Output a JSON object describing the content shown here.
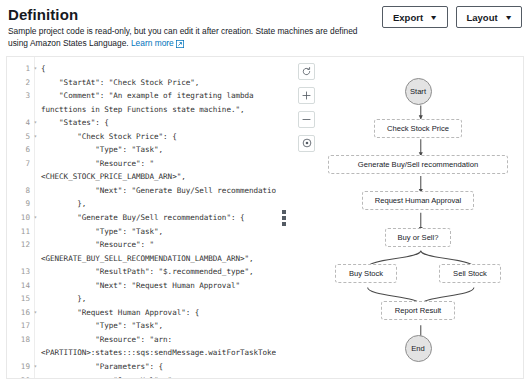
{
  "header": {
    "title": "Definition",
    "description_line1": "Sample project code is read-only, but you can edit it after creation. State machines are defined using",
    "description_line2": "Amazon States Language.",
    "learn_more_label": "Learn more",
    "external_link_icon": "external-link-icon",
    "buttons": [
      {
        "label": "Export",
        "caret": "▼"
      },
      {
        "label": "Layout",
        "caret": "▼"
      }
    ]
  },
  "editor": {
    "lines": [
      {
        "num": "1",
        "fold": true,
        "text": "{"
      },
      {
        "num": "2",
        "fold": false,
        "text": "    \"StartAt\": \"Check Stock Price\","
      },
      {
        "num": "3",
        "fold": false,
        "text": "    \"Comment\": \"An example of itegrating lambda"
      },
      {
        "num": "",
        "fold": false,
        "text": "functtions in Step Functions state machine.\","
      },
      {
        "num": "4",
        "fold": true,
        "text": "    \"States\": {"
      },
      {
        "num": "5",
        "fold": true,
        "text": "        \"Check Stock Price\": {"
      },
      {
        "num": "6",
        "fold": false,
        "text": "            \"Type\": \"Task\","
      },
      {
        "num": "7",
        "fold": false,
        "text": "            \"Resource\": \""
      },
      {
        "num": "",
        "fold": false,
        "text": "<CHECK_STOCK_PRICE_LAMBDA_ARN>\","
      },
      {
        "num": "8",
        "fold": false,
        "text": "            \"Next\": \"Generate Buy/Sell recommendation"
      },
      {
        "num": "9",
        "fold": false,
        "text": "        },"
      },
      {
        "num": "10",
        "fold": true,
        "text": "        \"Generate Buy/Sell recommendation\": {"
      },
      {
        "num": "11",
        "fold": false,
        "text": "            \"Type\": \"Task\","
      },
      {
        "num": "12",
        "fold": false,
        "text": "            \"Resource\": \""
      },
      {
        "num": "",
        "fold": false,
        "text": "<GENERATE_BUY_SELL_RECOMMENDATION_LAMBDA_ARN>\","
      },
      {
        "num": "13",
        "fold": false,
        "text": "            \"ResultPath\": \"$.recommended_type\","
      },
      {
        "num": "14",
        "fold": false,
        "text": "            \"Next\": \"Request Human Approval\""
      },
      {
        "num": "15",
        "fold": false,
        "text": "        },"
      },
      {
        "num": "16",
        "fold": true,
        "text": "        \"Request Human Approval\": {"
      },
      {
        "num": "17",
        "fold": false,
        "text": "            \"Type\": \"Task\","
      },
      {
        "num": "18",
        "fold": false,
        "text": "            \"Resource\": \"arn:"
      },
      {
        "num": "",
        "fold": false,
        "text": "<PARTITION>:states:::sqs:sendMessage.waitForTaskToken"
      },
      {
        "num": "19",
        "fold": true,
        "text": "            \"Parameters\": {"
      },
      {
        "num": "20",
        "fold": false,
        "text": "                \"QueueUrl\": \""
      },
      {
        "num": "",
        "fold": false,
        "text": "<REQUEST_HUMAN_APPROVAL_SQS_URL>\","
      }
    ]
  },
  "splitter": {
    "name": "panel-resize-handle"
  },
  "graph": {
    "controls": [
      {
        "icon": "refresh-icon",
        "name": "graph-refresh-button"
      },
      {
        "icon": "zoom-in-icon",
        "name": "graph-zoom-in-button"
      },
      {
        "icon": "zoom-out-icon",
        "name": "graph-zoom-out-button"
      },
      {
        "icon": "center-focus-icon",
        "name": "graph-center-button"
      }
    ],
    "nodes": [
      {
        "id": "start",
        "label": "Start",
        "shape": "circle",
        "cx": 126,
        "cy": 34
      },
      {
        "id": "check",
        "label": "Check Stock Price",
        "shape": "box",
        "cx": 126,
        "cy": 71
      },
      {
        "id": "generate",
        "label": "Generate Buy/Sell recommendation",
        "shape": "box",
        "cx": 126,
        "cy": 107
      },
      {
        "id": "approval",
        "label": "Request Human Approval",
        "shape": "box",
        "cx": 126,
        "cy": 143
      },
      {
        "id": "choice",
        "label": "Buy or Sell?",
        "shape": "box",
        "cx": 126,
        "cy": 180
      },
      {
        "id": "buy",
        "label": "Buy Stock",
        "shape": "box",
        "cx": 74,
        "cy": 216
      },
      {
        "id": "sell",
        "label": "Sell Stock",
        "shape": "box",
        "cx": 178,
        "cy": 216
      },
      {
        "id": "report",
        "label": "Report Result",
        "shape": "box",
        "cx": 126,
        "cy": 253
      },
      {
        "id": "end",
        "label": "End",
        "shape": "circle",
        "cx": 126,
        "cy": 291
      }
    ]
  }
}
